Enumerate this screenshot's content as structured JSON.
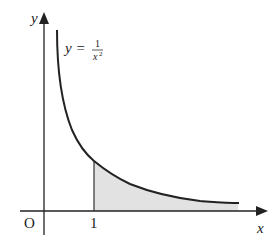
{
  "diagram": {
    "axes": {
      "x_label": "x",
      "y_label": "y",
      "origin_label": "O",
      "x_tick_label": "1"
    },
    "curve": {
      "equation_lhs": "y =",
      "numerator": "1",
      "denominator": "x",
      "exponent": "2"
    },
    "shaded_region": {
      "from_x": "1",
      "to_x": "∞",
      "fill": "#e2e2e2"
    },
    "colors": {
      "line": "#222222",
      "shade": "#e2e2e2",
      "background": "#ffffff"
    }
  }
}
